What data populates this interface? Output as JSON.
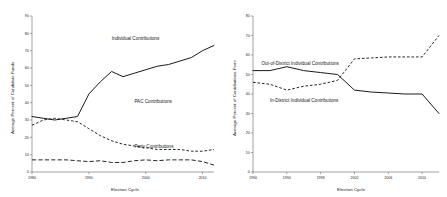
{
  "figure": {
    "background": "#ffffff",
    "ink_color": "#1a1a1a",
    "axis_color": "#555555"
  },
  "chart_data": [
    {
      "type": "line",
      "panel": "left",
      "title": "",
      "xlabel": "Election Cycle",
      "ylabel": "Average Percent of Candidate Funds",
      "xlim": [
        1980,
        2012
      ],
      "ylim": [
        0,
        90
      ],
      "xticks": [
        1980,
        1990,
        2000,
        2010
      ],
      "xticklabels": [
        "1980",
        "1990",
        "2000",
        "2010"
      ],
      "yticks": [
        0,
        10,
        20,
        30,
        40,
        50,
        60,
        70,
        80,
        90
      ],
      "yticklabels": [
        "0",
        "10",
        "20",
        "30",
        "40",
        "50",
        "60",
        "70",
        "80",
        "90"
      ],
      "grid": false,
      "legend": "inline-annotations",
      "x": [
        1980,
        1982,
        1984,
        1986,
        1988,
        1990,
        1992,
        1994,
        1996,
        1998,
        2000,
        2002,
        2004,
        2006,
        2008,
        2010,
        2012
      ],
      "series": [
        {
          "name": "Individual Contributions",
          "style": "solid",
          "label_x": 1994,
          "label_y": 76,
          "values": [
            32,
            31,
            30,
            31,
            32,
            45,
            52,
            58,
            55,
            57,
            59,
            61,
            62,
            64,
            66,
            70,
            73
          ]
        },
        {
          "name": "PAC Contributions",
          "style": "dashed",
          "label_x": 1998,
          "label_y": 40,
          "values": [
            27,
            30,
            31,
            30,
            29,
            25,
            21,
            18,
            16,
            15,
            14,
            13,
            13,
            13,
            12,
            12,
            13
          ]
        },
        {
          "name": "Party Contributions",
          "style": "long-dashed",
          "label_x": 1998,
          "label_y": 14,
          "values": [
            7,
            7,
            7,
            7,
            6.5,
            6,
            6.5,
            5.5,
            5.5,
            6.5,
            7,
            6.5,
            7,
            7,
            7,
            6,
            4
          ]
        }
      ]
    },
    {
      "type": "line",
      "panel": "right",
      "title": "",
      "xlabel": "Election Cycle",
      "ylabel": "Average Percent of Contributions From",
      "xlim": [
        1990,
        2012
      ],
      "ylim": [
        0,
        80
      ],
      "xticks": [
        1990,
        1994,
        1998,
        2002,
        2006,
        2010
      ],
      "xticklabels": [
        "1990",
        "1994",
        "1998",
        "2002",
        "2006",
        "2010"
      ],
      "yticks": [
        0,
        10,
        20,
        30,
        40,
        50,
        60,
        70,
        80
      ],
      "yticklabels": [
        "0",
        "10",
        "20",
        "30",
        "40",
        "50",
        "60",
        "70",
        "80"
      ],
      "grid": false,
      "legend": "inline-annotations",
      "x": [
        1990,
        1992,
        1994,
        1996,
        1998,
        2000,
        2002,
        2004,
        2006,
        2008,
        2010,
        2012
      ],
      "series": [
        {
          "name": "Out-of-District Individual Contributions",
          "style": "dashed",
          "label_x": 1991,
          "label_y": 55,
          "values": [
            46,
            45,
            42,
            44,
            45,
            47,
            58,
            58.5,
            59,
            59,
            59,
            70
          ]
        },
        {
          "name": "In-District Individual Contributions",
          "style": "solid",
          "label_x": 1992,
          "label_y": 36,
          "values": [
            52,
            52,
            54,
            52,
            51,
            50,
            42,
            41,
            40.5,
            40,
            40,
            30
          ]
        }
      ]
    }
  ]
}
